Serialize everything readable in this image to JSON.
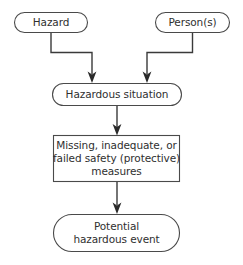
{
  "diagram": {
    "type": "flowchart",
    "stroke_color": "#4a4a4a",
    "arrow_color": "#2a2a2a",
    "text_color": "#2f2f2f",
    "background_color": "#ffffff",
    "nodes": {
      "hazard": {
        "label": "Hazard",
        "shape": "stadium"
      },
      "persons": {
        "label": "Person(s)",
        "shape": "stadium"
      },
      "hazardous_situation": {
        "label": "Hazardous situation",
        "shape": "stadium"
      },
      "measures": {
        "shape": "rectangle",
        "line1": "Missing, inadequate, or",
        "line2": "failed safety (protective)",
        "line3": "measures"
      },
      "potential_event": {
        "shape": "stadium",
        "line1": "Potential",
        "line2": "hazardous event"
      }
    },
    "edges": [
      {
        "from": "hazard",
        "to": "hazardous_situation",
        "style": "elbow-arrow"
      },
      {
        "from": "persons",
        "to": "hazardous_situation",
        "style": "elbow-arrow"
      },
      {
        "from": "hazardous_situation",
        "to": "measures",
        "style": "straight-arrow"
      },
      {
        "from": "measures",
        "to": "potential_event",
        "style": "straight-arrow"
      }
    ]
  }
}
